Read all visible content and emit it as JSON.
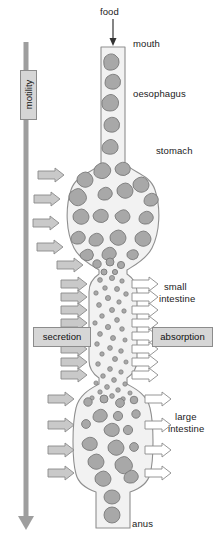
{
  "diagram": {
    "type": "biological-schematic"
  },
  "labels": {
    "food": "food",
    "mouth": "mouth",
    "oesophagus": "oesophagus",
    "stomach": "stomach",
    "small_intestine_line1": "small",
    "small_intestine_line2": "intestine",
    "large_intestine_line1": "large",
    "large_intestine_line2": "intestine",
    "anus": "anus",
    "motility": "motility",
    "secretion": "secretion",
    "absorption": "absorption"
  },
  "colors": {
    "lumen_fill": "#f2f2f2",
    "lumen_stroke": "#8f8f8f",
    "food_blob_fill": "#a8a8a8",
    "food_blob_stroke": "#7b7b7b",
    "secretion_arrow_fill": "#c9c9c9",
    "secretion_arrow_stroke": "#8a8a8a",
    "absorption_arrow_fill": "#ffffff",
    "absorption_arrow_stroke": "#8a8a8a",
    "motility_arrow_fill": "#9e9e9e",
    "label_box_fill": "#d6d6d6",
    "label_box_stroke": "#8c8c8c",
    "text": "#1a1a1a",
    "food_pointer": "#333333"
  },
  "counts": {
    "stomach_secretion_arrows": 5,
    "small_intestine_secretion_arrows": 8,
    "small_intestine_absorption_arrows": 8,
    "large_intestine_secretion_arrows": 4,
    "large_intestine_absorption_arrows": 4
  },
  "segments": [
    {
      "name": "mouth",
      "y_top": 46
    },
    {
      "name": "oesophagus",
      "y_top": 60,
      "y_bottom": 160
    },
    {
      "name": "stomach",
      "y_top": 160,
      "y_bottom": 268
    },
    {
      "name": "small-intestine",
      "y_top": 272,
      "y_bottom": 380
    },
    {
      "name": "large-intestine",
      "y_top": 384,
      "y_bottom": 490
    },
    {
      "name": "anus",
      "y_top": 490,
      "y_bottom": 528
    }
  ]
}
